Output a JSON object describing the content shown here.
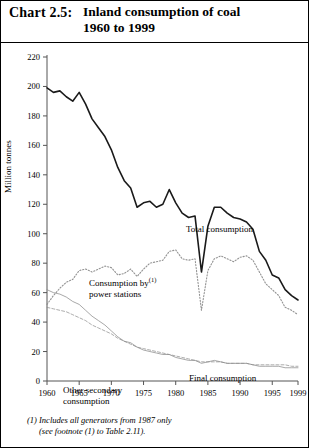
{
  "figure": {
    "chart_number": "Chart 2.5:",
    "title_line1": "Inland consumption of coal",
    "title_line2": "1960 to 1999",
    "footnote_line1": "(1) Includes all generators from 1987 only",
    "footnote_line2": "(see footnote (1) to Table 2.11).",
    "annotations": {
      "total": "Total consumption",
      "power_line1": "Consumption by",
      "power_line2": "power stations",
      "power_superscript": "(1)",
      "final": "Final consumption",
      "other_line1": "Other secondary",
      "other_line2": "consumption"
    }
  },
  "chart_data": {
    "type": "line",
    "title": "Inland consumption of coal 1960 to 1999",
    "xlabel": "",
    "ylabel": "Million tonnes",
    "ylim": [
      0,
      220
    ],
    "yticks": [
      0,
      20,
      40,
      60,
      80,
      100,
      120,
      140,
      160,
      180,
      200,
      220
    ],
    "xlim": [
      1960,
      1999
    ],
    "xticks": [
      1960,
      1965,
      1970,
      1975,
      1980,
      1985,
      1990,
      1995,
      1999
    ],
    "grid": false,
    "legend": "inline-annotations",
    "x": [
      1960,
      1961,
      1962,
      1963,
      1964,
      1965,
      1966,
      1967,
      1968,
      1969,
      1970,
      1971,
      1972,
      1973,
      1974,
      1975,
      1976,
      1977,
      1978,
      1979,
      1980,
      1981,
      1982,
      1983,
      1984,
      1985,
      1986,
      1987,
      1988,
      1989,
      1990,
      1991,
      1992,
      1993,
      1994,
      1995,
      1996,
      1997,
      1998,
      1999
    ],
    "series": [
      {
        "name": "Total consumption",
        "style": "solid",
        "color": "#1a1a1a",
        "values": [
          199,
          196,
          197,
          193,
          190,
          196,
          188,
          178,
          172,
          166,
          157,
          145,
          136,
          131,
          118,
          121,
          122,
          118,
          120,
          130,
          121,
          114,
          111,
          112,
          74,
          105,
          118,
          118,
          114,
          111,
          110,
          108,
          103,
          88,
          82,
          72,
          70,
          62,
          58,
          55
        ]
      },
      {
        "name": "Consumption by power stations",
        "style": "dotted",
        "color": "#8c8c8c",
        "values": [
          52,
          58,
          63,
          67,
          69,
          75,
          76,
          74,
          76,
          78,
          77,
          72,
          73,
          76,
          71,
          76,
          80,
          81,
          82,
          88,
          89,
          83,
          82,
          83,
          48,
          75,
          83,
          85,
          83,
          81,
          84,
          85,
          82,
          74,
          66,
          62,
          58,
          50,
          48,
          45
        ]
      },
      {
        "name": "Final consumption",
        "style": "solid-light",
        "color": "#8c8c8c",
        "values": [
          62,
          60,
          59,
          57,
          54,
          52,
          48,
          44,
          41,
          38,
          34,
          30,
          27,
          26,
          23,
          21,
          20,
          19,
          18,
          18,
          16,
          15,
          14,
          14,
          12,
          13,
          14,
          13,
          12,
          12,
          12,
          12,
          11,
          10,
          10,
          10,
          10,
          9,
          9,
          9
        ]
      },
      {
        "name": "Other secondary consumption",
        "style": "dashed-light",
        "color": "#8c8c8c",
        "values": [
          50,
          49,
          48,
          47,
          45,
          43,
          41,
          38,
          36,
          34,
          32,
          29,
          27,
          25,
          23,
          22,
          21,
          20,
          19,
          18,
          17,
          16,
          15,
          14,
          13,
          13,
          13,
          13,
          12,
          12,
          12,
          12,
          11,
          11,
          11,
          11,
          11,
          11,
          10,
          10
        ]
      }
    ]
  }
}
